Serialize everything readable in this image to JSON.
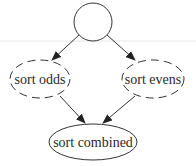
{
  "diagram": {
    "type": "directed-graph",
    "background": "#ffffff",
    "stroke_color": "#333333",
    "nodes": [
      {
        "id": "start",
        "label": "",
        "shape": "circle",
        "style": "solid"
      },
      {
        "id": "odds",
        "label": "sort odds",
        "shape": "ellipse",
        "style": "dashed"
      },
      {
        "id": "evens",
        "label": "sort evens",
        "shape": "ellipse",
        "style": "dashed"
      },
      {
        "id": "combined",
        "label": "sort combined",
        "shape": "ellipse",
        "style": "solid"
      }
    ],
    "edges": [
      {
        "from": "start",
        "to": "odds"
      },
      {
        "from": "start",
        "to": "evens"
      },
      {
        "from": "odds",
        "to": "combined"
      },
      {
        "from": "evens",
        "to": "combined"
      }
    ]
  }
}
